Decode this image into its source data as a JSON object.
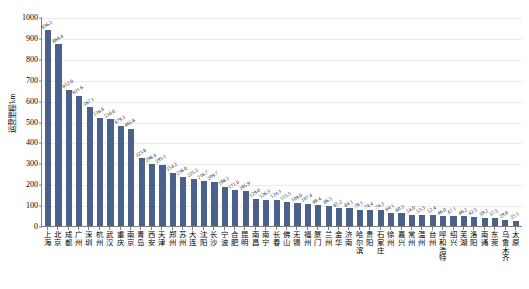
{
  "chart_data": {
    "type": "bar",
    "title": "",
    "xlabel": "",
    "ylabel": "运营里程/km",
    "ylim": [
      0,
      1000
    ],
    "ytick_step": 100,
    "yticks": [
      0,
      100,
      200,
      300,
      400,
      500,
      600,
      700,
      800,
      900,
      1000
    ],
    "grid": true,
    "legend": "none",
    "bar_color": "#4a618c",
    "axis_color": "#7f7f7f",
    "gridline_color": "#e9e9ef",
    "categories": [
      "上海",
      "北京",
      "成都",
      "广州",
      "深圳",
      "杭州",
      "武汉",
      "重庆",
      "南京",
      "青岛",
      "西安",
      "天津",
      "郑州",
      "苏州",
      "大连",
      "沈阳",
      "长沙",
      "宁波",
      "合肥",
      "昆明",
      "南昌",
      "南宁",
      "长春",
      "佛山",
      "无锡",
      "福州",
      "厦门",
      "兰州",
      "金华",
      "济南",
      "哈尔滨",
      "贵阳",
      "石家庄",
      "徐州",
      "嘉兴",
      "常州",
      "温州",
      "台州",
      "呼和浩特",
      "绍兴",
      "芜湖",
      "洛阳",
      "南通",
      "东莞",
      "乌鲁木齐",
      "太原"
    ],
    "values": [
      936.2,
      869.4,
      652.0,
      621.6,
      567.1,
      516.0,
      510.0,
      479.3,
      465.8,
      323.8,
      298.4,
      293.1,
      254.2,
      236.0,
      225.5,
      216.7,
      209.7,
      188.1,
      171.0,
      165.9,
      129.0,
      126.3,
      124.3,
      115.5,
      109.0,
      107.4,
      98.4,
      96.5,
      85.2,
      84.1,
      78.1,
      74.4,
      74.3,
      64.1,
      60.3,
      54.0,
      53.3,
      52.4,
      46.0,
      47.1,
      46.2,
      42.5,
      39.2,
      37.5,
      29.8,
      25.1
    ]
  }
}
